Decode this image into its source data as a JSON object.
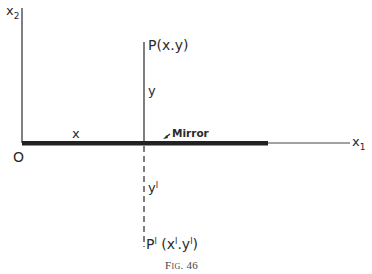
{
  "diagram": {
    "axes": {
      "vertical_label": "x",
      "vertical_subscript": "2",
      "horizontal_label": "x",
      "horizontal_subscript": "1",
      "origin_label": "O"
    },
    "mirror": {
      "label": "Mirror",
      "x_segment_label": "x"
    },
    "point": {
      "label": "P(x.y)",
      "height_label": "y"
    },
    "image_point": {
      "label_prefix": "P",
      "label_prime": "I",
      "label_coords": "(x",
      "label_coords_prime": "I",
      "label_coords_sep": ".y",
      "label_coords_prime2": "I",
      "label_coords_end": ")",
      "depth_label": "y",
      "depth_prime": "I"
    },
    "caption": "Fig. 46",
    "colors": {
      "line": "#2a2a2a",
      "mirror": "#222222",
      "background": "#ffffff"
    }
  }
}
